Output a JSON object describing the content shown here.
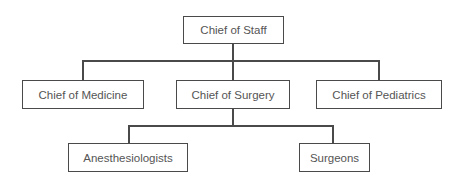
{
  "diagram": {
    "type": "org-chart",
    "root": {
      "label": "Chief of Staff",
      "children": [
        {
          "label": "Chief of Medicine"
        },
        {
          "label": "Chief of Surgery",
          "children": [
            {
              "label": "Anesthesiologists"
            },
            {
              "label": "Surgeons"
            }
          ]
        },
        {
          "label": "Chief of Pediatrics"
        }
      ]
    }
  },
  "nodes": {
    "chief_of_staff": "Chief of Staff",
    "chief_of_medicine": "Chief of Medicine",
    "chief_of_surgery": "Chief of Surgery",
    "chief_of_pediatrics": "Chief of Pediatrics",
    "anesthesiologists": "Anesthesiologists",
    "surgeons": "Surgeons"
  },
  "colors": {
    "line": "#4a4a4a",
    "text": "#555555",
    "background": "#ffffff"
  }
}
